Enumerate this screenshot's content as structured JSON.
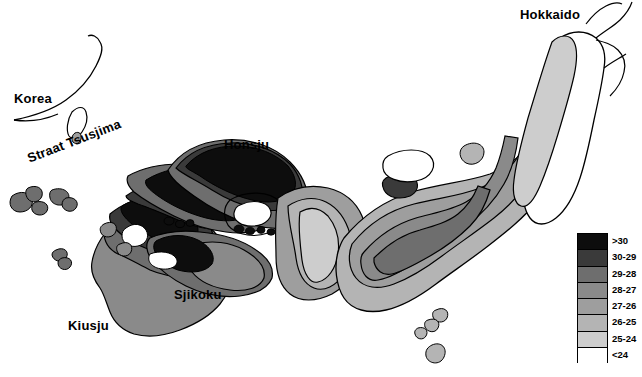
{
  "figure": {
    "kind": "thematic-map",
    "region": "Japan",
    "background_color": "#ffffff",
    "line_color": "#000000"
  },
  "map_labels": [
    {
      "name": "korea",
      "text": "Korea"
    },
    {
      "name": "tsusjima",
      "text": "Straat Tsusjima"
    },
    {
      "name": "honsju",
      "text": "Honsju"
    },
    {
      "name": "sjikoku",
      "text": "Sjikoku"
    },
    {
      "name": "kiusju",
      "text": "Kiusju"
    },
    {
      "name": "hokkaido",
      "text": "Hokkaido"
    }
  ],
  "legend": {
    "bands": [
      {
        "label": ">30",
        "color": "#0d0d0d"
      },
      {
        "label": "30-29",
        "color": "#3a3a3a"
      },
      {
        "label": "29-28",
        "color": "#6e6e6e"
      },
      {
        "label": "28-27",
        "color": "#8a8a8a"
      },
      {
        "label": "27-26",
        "color": "#9e9e9e"
      },
      {
        "label": "26-25",
        "color": "#b4b4b4"
      },
      {
        "label": "25-24",
        "color": "#cdcdcd"
      },
      {
        "label": "<24",
        "color": "#ffffff"
      }
    ]
  },
  "chart_data": {
    "type": "heatmap",
    "title": "",
    "xlabel": "",
    "ylabel": "",
    "classes": [
      ">30",
      "30-29",
      "29-28",
      "28-27",
      "27-26",
      "26-25",
      "25-24",
      "<24"
    ],
    "class_colors": [
      "#0d0d0d",
      "#3a3a3a",
      "#6e6e6e",
      "#8a8a8a",
      "#9e9e9e",
      "#b4b4b4",
      "#cdcdcd",
      "#ffffff"
    ],
    "legend_position": "bottom-right",
    "grid": false,
    "regions": [
      {
        "name": "Kiusju",
        "class": "28-27"
      },
      {
        "name": "Kiusju-north",
        "class": "29-28"
      },
      {
        "name": "Kiusju-northtip",
        "class": ">30"
      },
      {
        "name": "Honsju-west",
        "class": ">30"
      },
      {
        "name": "Honsju-west-rim",
        "class": "30-29"
      },
      {
        "name": "Honsju-central",
        "class": "29-28"
      },
      {
        "name": "Honsju-east",
        "class": "27-26"
      },
      {
        "name": "Honsju-northeast",
        "class": "26-25"
      },
      {
        "name": "Honsju-inland-sea-enclave",
        "class": "<24"
      },
      {
        "name": "Sjikoku",
        "class": "29-28"
      },
      {
        "name": "Sjikoku-north",
        "class": ">30"
      },
      {
        "name": "Hokkaido",
        "class": "<24"
      },
      {
        "name": "Hokkaido-west",
        "class": "25-24"
      },
      {
        "name": "Izu-islands",
        "class": "26-25"
      },
      {
        "name": "Goto-islands",
        "class": "29-28"
      }
    ]
  }
}
